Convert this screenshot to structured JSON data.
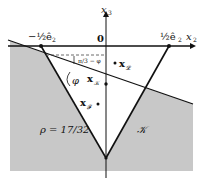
{
  "diagram": {
    "axes": {
      "x_label": "x",
      "x_sub": "2",
      "y_label": "x",
      "y_sub": "3",
      "origin_label": "0"
    },
    "vertex_labels": {
      "left": "−½ê",
      "left_sub": "2",
      "right": "½ê",
      "right_sub": "2"
    },
    "points": {
      "xL": {
        "label": "x",
        "sub": "𝓛"
      },
      "xK": {
        "label": "x",
        "sub": "𝒦"
      },
      "xF": {
        "label": "x",
        "sub": "𝓕"
      }
    },
    "angles": {
      "top": "π/3 − φ",
      "bottom": "φ"
    },
    "region_labels": {
      "rho": "ρ = 17/32",
      "cone": "𝒦"
    },
    "colors": {
      "shade": "#c8c8c8",
      "line": "#111111"
    }
  }
}
